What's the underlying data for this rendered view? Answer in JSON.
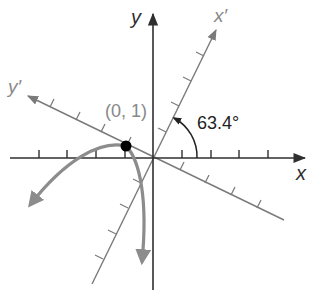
{
  "figure": {
    "labels": {
      "x_axis": "x",
      "y_axis": "y",
      "x_prime_axis": "x′",
      "y_prime_axis": "y′",
      "point": "(0, 1)",
      "angle": "63.4°"
    },
    "rotation_angle_deg": 63.4,
    "highlight_point": {
      "label": "(0, 1)",
      "system": "x'y'"
    },
    "ticks": {
      "x_axis_per_side": 4,
      "y_prime_axis_positive": 4,
      "x_prime_axis_positive": 4,
      "x_prime_axis_negative": 4,
      "y_prime_axis_negative": 4
    },
    "colors": {
      "axes": "#3a3a3a",
      "rotated_axes": "#7a7a7a",
      "curve": "#8c8c8c",
      "point": "#000000",
      "label_gray": "#888888"
    }
  }
}
